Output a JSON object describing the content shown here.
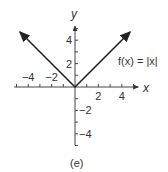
{
  "chart_data": {
    "type": "line",
    "title": "",
    "function_label": "f(x) = |x|",
    "xlabel": "x",
    "ylabel": "y",
    "xlim": [
      -5.2,
      5.4
    ],
    "ylim": [
      -5,
      5.2
    ],
    "x_ticks": [
      -5,
      -4,
      -3,
      -2,
      -1,
      1,
      2,
      3,
      4,
      5
    ],
    "y_ticks": [
      -5,
      -4,
      -3,
      -2,
      -1,
      1,
      2,
      3,
      4,
      5
    ],
    "x_tick_labels": [
      {
        "value": -4,
        "label": "−4"
      },
      {
        "value": -2,
        "label": "−2"
      },
      {
        "value": 2,
        "label": "2"
      },
      {
        "value": 4,
        "label": "4"
      }
    ],
    "y_tick_labels": [
      {
        "value": 4,
        "label": "4"
      },
      {
        "value": 2,
        "label": "2"
      },
      {
        "value": -2,
        "label": "−2"
      },
      {
        "value": -4,
        "label": "−4"
      }
    ],
    "series": [
      {
        "name": "f(x) = |x|",
        "x": [
          -4.7,
          0,
          4.7
        ],
        "y": [
          4.7,
          0,
          4.7
        ],
        "arrows": "both-ends"
      }
    ],
    "grid": false,
    "caption": "(e)"
  }
}
